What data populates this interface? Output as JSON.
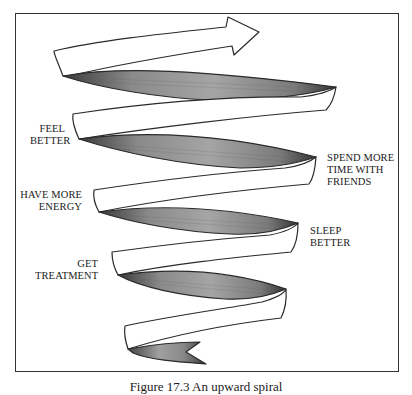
{
  "diagram": {
    "type": "upward-spiral",
    "colors": {
      "frame": "#333333",
      "ribbon_outline": "#2a2a2a",
      "ribbon_shade_dark": "#555555",
      "ribbon_shade_light": "#9a9a9a",
      "background": "#ffffff"
    },
    "labels": [
      {
        "id": "feel-better",
        "lines": [
          "FEEL",
          "BETTER"
        ],
        "side": "left"
      },
      {
        "id": "spend-more-time-with-friends",
        "lines": [
          "SPEND MORE",
          "TIME WITH",
          "FRIENDS"
        ],
        "side": "right"
      },
      {
        "id": "have-more-energy",
        "lines": [
          "HAVE MORE",
          "ENERGY"
        ],
        "side": "left"
      },
      {
        "id": "sleep-better",
        "lines": [
          "SLEEP",
          "BETTER"
        ],
        "side": "right"
      },
      {
        "id": "get-treatment",
        "lines": [
          "GET",
          "TREATMENT"
        ],
        "side": "left"
      }
    ],
    "caption": "Figure 17.3   An upward spiral"
  }
}
